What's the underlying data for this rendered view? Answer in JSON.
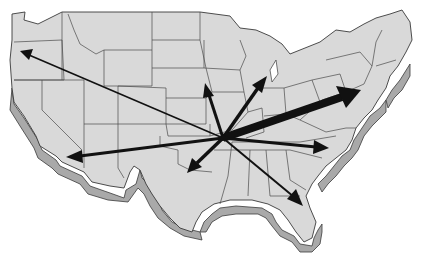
{
  "map": {
    "subject": "United States 3D relief map with flow arrows",
    "colors": {
      "land": "#d9d9d9",
      "extrusion": "#a9a9a9",
      "borders": "#3a3a3a",
      "arrows": "#111111",
      "background": "#ffffff"
    },
    "hub": {
      "x": 223,
      "y": 138,
      "region": "central-midwest"
    },
    "arrows": [
      {
        "id": "to-northwest",
        "region": "Oregon",
        "x": 20,
        "y": 51,
        "width": 1.5,
        "head": 7
      },
      {
        "id": "to-southwest",
        "region": "Southern California",
        "x": 68,
        "y": 157,
        "width": 3,
        "head": 10
      },
      {
        "id": "to-north",
        "region": "Minnesota/Iowa",
        "x": 206,
        "y": 84,
        "width": 3,
        "head": 9
      },
      {
        "id": "to-great-lakes",
        "region": "Chicago/Wisconsin",
        "x": 266,
        "y": 77,
        "width": 3.5,
        "head": 10
      },
      {
        "id": "to-northeast",
        "region": "New York",
        "x": 360,
        "y": 90,
        "width": 8,
        "head": 15
      },
      {
        "id": "to-southeast",
        "region": "Carolinas",
        "x": 328,
        "y": 148,
        "width": 3,
        "head": 10
      },
      {
        "id": "to-south",
        "region": "Texas",
        "x": 188,
        "y": 172,
        "width": 3.5,
        "head": 10
      },
      {
        "id": "to-florida",
        "region": "Florida",
        "x": 302,
        "y": 205,
        "width": 2,
        "head": 9
      }
    ]
  }
}
